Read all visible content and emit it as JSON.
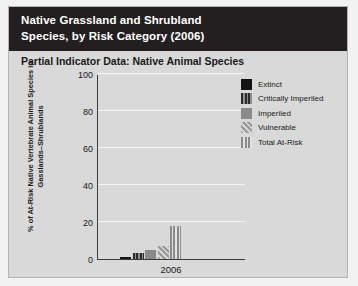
{
  "title": {
    "line1": "Native Grassland and Shrubland",
    "line2": "Species, by Risk Category (2006)"
  },
  "subtitle": "Partial Indicator Data: Native Animal Species",
  "colors": {
    "title_bar_background": "#231f20",
    "title_text": "#ffffff",
    "panel_background": "#d9d9d9",
    "panel_border": "#b3b3b3",
    "page_background": "#f2f2f2",
    "axis": "#3b3b3b",
    "gridline": "#f4f4f4",
    "extinct": "#151515",
    "critically_imperiled": "#2b2b2b",
    "imperiled": "#8a8a8a",
    "vulnerable": "#9a9a9a",
    "total_at_risk": "#8a8a8a"
  },
  "chart_data": {
    "type": "bar",
    "title": "Partial Indicator Data: Native Animal Species",
    "categories": [
      "2006"
    ],
    "xlabel": "2006",
    "ylabel": "% of At-Risk Native Vertebrate Animal Species in Gasslands–Shrublands",
    "ylim": [
      0,
      100
    ],
    "yticks": [
      0,
      20,
      40,
      60,
      80,
      100
    ],
    "ytick_labels": [
      "0",
      "20",
      "40",
      "60",
      "80",
      "100"
    ],
    "grid": true,
    "legend_position": "right",
    "series": [
      {
        "name": "Extinct",
        "pattern": "solid-black",
        "values": [
          1
        ]
      },
      {
        "name": "Critically Imperiled",
        "pattern": "vertical-dark",
        "values": [
          3
        ]
      },
      {
        "name": "Imperiled",
        "pattern": "solid-gray",
        "values": [
          5
        ]
      },
      {
        "name": "Vulnerable",
        "pattern": "diagonal-hatch",
        "values": [
          7
        ]
      },
      {
        "name": "Total At-Risk",
        "pattern": "vertical-light",
        "values": [
          18
        ]
      }
    ]
  }
}
